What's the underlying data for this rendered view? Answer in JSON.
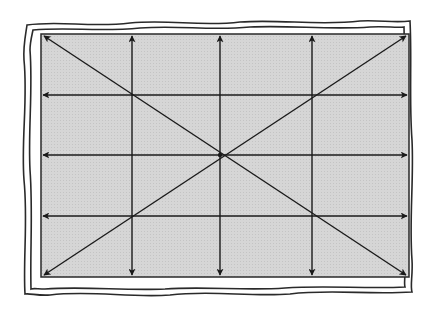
{
  "diagram": {
    "title": "",
    "colors": {
      "background": "#ffffff",
      "panel_fill": "#d4d4d4",
      "line": "#1a1a1a",
      "frame": "#2a2a2a"
    },
    "panel": {
      "x": 41,
      "y": 34,
      "width": 368,
      "height": 243
    },
    "vertical_arrows_x": [
      132,
      220,
      312
    ],
    "horizontal_arrows_y": [
      95,
      155,
      216
    ],
    "center": {
      "x": 220,
      "y": 155
    },
    "diagonals": [
      {
        "from": [
          41,
          34
        ],
        "to": [
          409,
          277
        ]
      },
      {
        "from": [
          409,
          34
        ],
        "to": [
          41,
          277
        ]
      }
    ],
    "icons": {
      "frame": "wavy-double-border",
      "arrowhead": "filled-triangle"
    }
  }
}
